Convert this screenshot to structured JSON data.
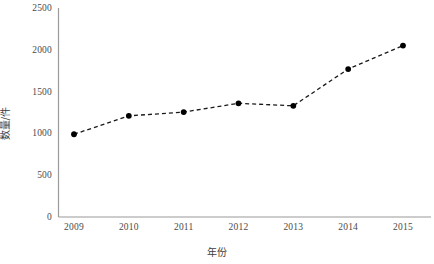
{
  "chart_data": {
    "type": "line",
    "title": "",
    "subtitle": "",
    "xlabel": "年份",
    "ylabel": "数量/件",
    "categories": [
      "2009",
      "2010",
      "2011",
      "2012",
      "2013",
      "2014",
      "2015"
    ],
    "values": [
      990,
      1210,
      1255,
      1360,
      1330,
      1770,
      2050
    ],
    "series": [
      {
        "name": "数量/件",
        "values": [
          990,
          1210,
          1255,
          1360,
          1330,
          1770,
          2050
        ]
      }
    ],
    "x_tick_labels": [
      "2009",
      "2010",
      "2011",
      "2012",
      "2013",
      "2014",
      "2015"
    ],
    "y_tick_labels": [
      "0",
      "500",
      "1000",
      "1500",
      "2000",
      "2500"
    ],
    "y_ticks": [
      0,
      500,
      1000,
      1500,
      2000,
      2500
    ],
    "ylim": [
      0,
      2500
    ],
    "grid": false,
    "legend": false,
    "legend_position": "none",
    "marker": "filled-circle",
    "line_style": "dashed",
    "line_color": "#1a1a1a",
    "marker_color": "#000000",
    "axis_color": "#9a9a9a",
    "background_color": "#ffffff",
    "text_color": "#4a4a4a"
  }
}
